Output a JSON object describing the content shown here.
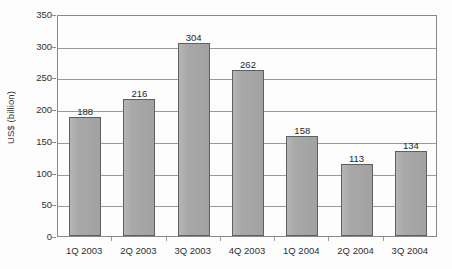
{
  "chart_data": {
    "type": "bar",
    "title": "",
    "subtitle": "",
    "xlabel": "",
    "ylabel": "US$ (billion)",
    "categories": [
      "1Q 2003",
      "2Q 2003",
      "3Q 2003",
      "4Q 2003",
      "1Q 2004",
      "2Q 2004",
      "3Q 2004"
    ],
    "values": [
      188,
      216,
      304,
      262,
      158,
      113,
      134
    ],
    "data_labels": [
      "188",
      "216",
      "304",
      "262",
      "158",
      "113",
      "134"
    ],
    "ylim": [
      0,
      350
    ],
    "ytick_step": 50,
    "ytick_labels": [
      "350",
      "300",
      "250",
      "200",
      "150",
      "100",
      "50",
      "0"
    ],
    "ytick_values": [
      350,
      300,
      250,
      200,
      150,
      100,
      50,
      0
    ],
    "grid": "horizontal",
    "legend": "none",
    "series": [
      {
        "name": "",
        "values": [
          188,
          216,
          304,
          262,
          158,
          113,
          134
        ]
      }
    ],
    "colors": {
      "bar_fill": "#a8a8a8",
      "bar_border": "#5f5f5f",
      "gridline": "#9a9a9a",
      "axis": "#8a8a8a",
      "text": "#2b2b2b",
      "background": "#fdfdfd"
    }
  }
}
